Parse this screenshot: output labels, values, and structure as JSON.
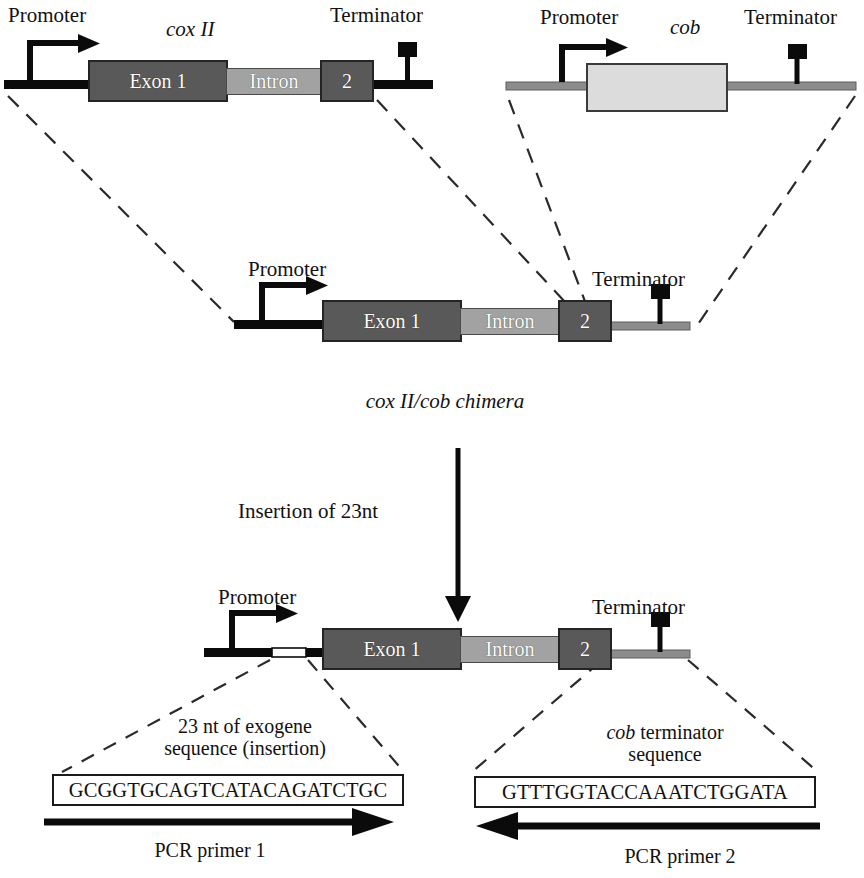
{
  "figure": {
    "colors": {
      "exon_fill": "#595959",
      "intron_fill": "#a2a2a2",
      "cob_fill": "#dcdcdc",
      "backbone_black": "#0b0b0b",
      "backbone_gray": "#8c8c8c",
      "outline": "#242424",
      "page_background": "#ffffff"
    }
  },
  "constructs": {
    "cox2": {
      "name": "cox II",
      "promoter_label": "Promoter",
      "terminator_label": "Terminator",
      "elements": [
        {
          "label": "Exon 1",
          "kind": "exon"
        },
        {
          "label": "Intron",
          "kind": "intron"
        },
        {
          "label": "2",
          "kind": "exon"
        }
      ]
    },
    "cob": {
      "name": "cob",
      "promoter_label": "Promoter",
      "terminator_label": "Terminator",
      "elements": [
        {
          "label": "",
          "kind": "cob-orf"
        }
      ]
    },
    "chimera": {
      "name": "cox II/cob chimera",
      "caption": "cox II/cob chimera",
      "promoter_label": "Promoter",
      "terminator_label": "Terminator",
      "elements": [
        {
          "label": "Exon 1",
          "kind": "exon"
        },
        {
          "label": "Intron",
          "kind": "intron"
        },
        {
          "label": "2",
          "kind": "exon"
        }
      ]
    },
    "inserted": {
      "promoter_label": "Promoter",
      "terminator_label": "Terminator",
      "elements": [
        {
          "label": "Exon 1",
          "kind": "exon"
        },
        {
          "label": "Intron",
          "kind": "intron"
        },
        {
          "label": "2",
          "kind": "exon"
        }
      ]
    }
  },
  "process": {
    "step_label": "Insertion of 23nt",
    "arrow": "down-arrow"
  },
  "callouts": {
    "left": {
      "line1": "23 nt of exogene",
      "line2": "sequence (insertion)",
      "sequence": "GCGGTGCAGTCATACAGATCTGC",
      "primer_label": "PCR primer 1",
      "primer_direction": "forward"
    },
    "right": {
      "line1_italic": "cob",
      "line1_rest": " terminator",
      "line2": "sequence",
      "sequence": "GTTTGGTACCAAATCTGGATA",
      "primer_label": "PCR primer 2",
      "primer_direction": "reverse"
    }
  }
}
